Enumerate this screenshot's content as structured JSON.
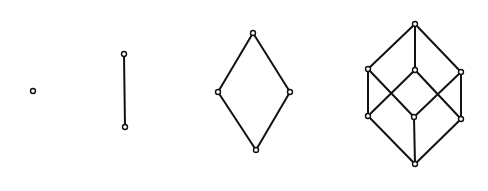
{
  "diagram": {
    "type": "hasse-diagrams-boolean-lattices",
    "colors": {
      "stroke": "#111111",
      "background": "#ffffff",
      "node_fill": "#ffffff"
    },
    "node_radius": 2.5,
    "graphs": [
      {
        "name": "B0-point",
        "nodes": [
          [
            33,
            91
          ]
        ],
        "edges": []
      },
      {
        "name": "B1-segment",
        "nodes": [
          [
            124,
            54
          ],
          [
            125,
            127
          ]
        ],
        "edges": [
          [
            0,
            1
          ]
        ]
      },
      {
        "name": "B2-diamond",
        "nodes": [
          [
            253,
            33
          ],
          [
            218,
            92
          ],
          [
            290,
            92
          ],
          [
            256,
            150
          ]
        ],
        "edges": [
          [
            0,
            1
          ],
          [
            0,
            2
          ],
          [
            1,
            3
          ],
          [
            2,
            3
          ]
        ]
      },
      {
        "name": "B3-cube",
        "nodes": [
          [
            415,
            24
          ],
          [
            368,
            69
          ],
          [
            415,
            70
          ],
          [
            461,
            72
          ],
          [
            368,
            116
          ],
          [
            414,
            117
          ],
          [
            461,
            119
          ],
          [
            415,
            164
          ]
        ],
        "edges": [
          [
            0,
            1
          ],
          [
            0,
            2
          ],
          [
            0,
            3
          ],
          [
            1,
            4
          ],
          [
            1,
            5
          ],
          [
            2,
            4
          ],
          [
            2,
            6
          ],
          [
            3,
            5
          ],
          [
            3,
            6
          ],
          [
            4,
            7
          ],
          [
            5,
            7
          ],
          [
            6,
            7
          ]
        ]
      }
    ]
  }
}
